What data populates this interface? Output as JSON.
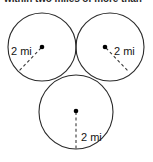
{
  "figure": {
    "prompt_text": "within two miles of more than",
    "stroke_color": "#2b2b2b",
    "dash_color": "#3a3a3a",
    "dot_color": "#000000",
    "background": "#ffffff",
    "circles": [
      {
        "id": "left-circle",
        "cx": 42,
        "cy": 47,
        "r": 34,
        "radius_label": "2 mi"
      },
      {
        "id": "right-circle",
        "cx": 110,
        "cy": 47,
        "r": 34,
        "radius_label": "2 mi"
      },
      {
        "id": "bottom-circle",
        "cx": 76,
        "cy": 112,
        "r": 37,
        "radius_label": "2 mi"
      }
    ],
    "labels": {
      "left": "2 mi",
      "right": "2 mi",
      "bottom": "2 mi"
    },
    "radius_lines": [
      {
        "id": "left-radius",
        "x1": 42,
        "y1": 47,
        "x2": 19,
        "y2": 71
      },
      {
        "id": "right-radius",
        "x1": 105,
        "y1": 46,
        "x2": 128,
        "y2": 71
      },
      {
        "id": "bottom-radius",
        "x1": 76,
        "y1": 111,
        "x2": 76,
        "y2": 150
      }
    ]
  }
}
